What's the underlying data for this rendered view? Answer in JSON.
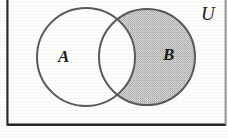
{
  "figure": {
    "kind": "venn-diagram",
    "caption_visible": false,
    "width": 228,
    "height": 138,
    "background_color": "#fdfdfc"
  },
  "universe": {
    "label": "U",
    "label_x": 207,
    "label_y": 13,
    "rect": {
      "x": 7,
      "y": -6,
      "width": 219,
      "height": 131,
      "stroke_color": "#333333",
      "stroke_width": 1.6,
      "fill": "none",
      "top_edge_cropped": true
    }
  },
  "sets": [
    {
      "id": "A",
      "label": "A",
      "label_x": 63,
      "label_y": 57,
      "cx": 86,
      "cy": 57,
      "r": 49,
      "fill": "#ffffff",
      "stroke_color": "#575757",
      "stroke_width": 2,
      "shaded": false
    },
    {
      "id": "B",
      "label": "B",
      "label_x": 168,
      "label_y": 55,
      "cx": 147,
      "cy": 57,
      "r": 48,
      "fill": "#c9c9c9",
      "stroke_color": "#575757",
      "stroke_width": 2,
      "shaded": true
    }
  ],
  "shading": {
    "region": "B-only",
    "description": "B minus A",
    "pattern": "fine halftone dots",
    "pattern_color": "#b0b0b0",
    "base_color": "#d2d2d2",
    "intersection_shaded": false,
    "intersection_fill": "#ffffff"
  },
  "colors": {
    "ink": "#1a1a1a",
    "circle_stroke": "#575757",
    "frame_stroke": "#333333",
    "frame_bottom_stroke": "#1f1f1f",
    "shade_fill": "#c9c9c9",
    "page": "#fdfdfc"
  }
}
